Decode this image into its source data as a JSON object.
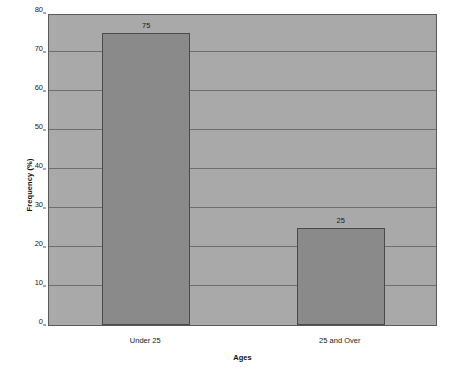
{
  "chart_data": {
    "type": "bar",
    "title": "",
    "subtitle": "",
    "categories": [
      "Under 25",
      "25 and Over"
    ],
    "values": [
      75,
      25
    ],
    "data_labels": [
      "75",
      "25"
    ],
    "xlabel": "Ages",
    "ylabel": "Frequency (%)",
    "ylim": [
      0,
      80
    ],
    "ytick_step": 10,
    "yticks": [
      "80",
      "70",
      "60",
      "50",
      "40",
      "30",
      "20",
      "10",
      "0"
    ],
    "ytick_values": [
      80,
      70,
      60,
      50,
      40,
      30,
      20,
      10,
      0
    ],
    "grid": true,
    "grid_axis": "y",
    "legend": false,
    "legend_position": "none",
    "colors": {
      "bar_fill": "#8a8a8a",
      "bar_border": "#4a4a4a",
      "plot_background": "#a9a9a9",
      "plot_border": "#5a5a5a",
      "gridline": "#6e6e6e",
      "page_background": "#ffffff",
      "text": "#1a1a1a"
    }
  }
}
